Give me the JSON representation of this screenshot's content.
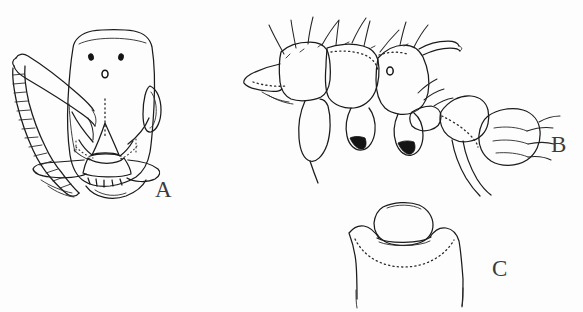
{
  "figure": {
    "kind": "scientific-line-drawing",
    "background_color": "#fdfdfd",
    "ink_color": "#1b1b1b",
    "width": 583,
    "height": 312,
    "panels": [
      {
        "id": "A",
        "label": "A",
        "label_x": 155,
        "label_y": 197,
        "caption": "head in full-face view",
        "features": [
          "head capsule outline",
          "three ocelli",
          "compound eye",
          "frontal carinae",
          "clypeus",
          "mandibles",
          "antennal scape",
          "antennal funiculus segments"
        ]
      },
      {
        "id": "B",
        "label": "B",
        "label_x": 551,
        "label_y": 152,
        "caption": "mesosoma in lateral view",
        "features": [
          "pronotum",
          "mesonotum",
          "propodeum",
          "metapleural gland",
          "erect setae",
          "coxae",
          "dark trochanters",
          "petiole",
          "postpetiole",
          "gaster base"
        ]
      },
      {
        "id": "C",
        "label": "C",
        "label_x": 492,
        "label_y": 276,
        "caption": "petiole and postpetiole in dorsal view",
        "features": [
          "postpetiole dorsal outline",
          "gaster anterior margin",
          "dotted suture line"
        ]
      }
    ]
  }
}
